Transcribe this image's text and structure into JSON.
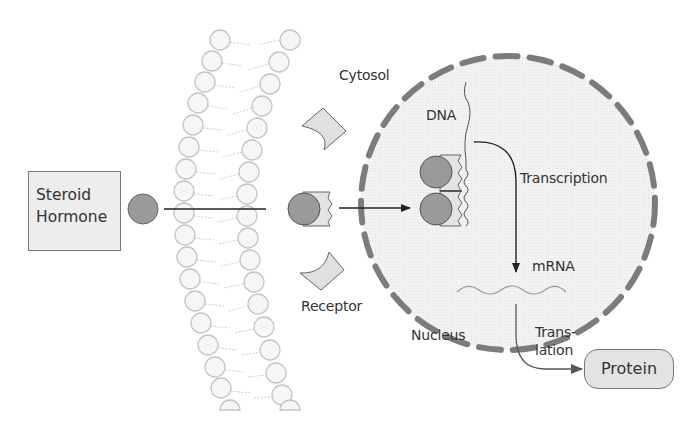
{
  "diagram": {
    "labels": {
      "steroid_hormone_line1": "Steroid",
      "steroid_hormone_line2": "Hormone",
      "cytosol": "Cytosol",
      "dna": "DNA",
      "transcription": "Transcription",
      "mrna": "mRNA",
      "receptor": "Receptor",
      "nucleus": "Nucleus",
      "translation_line1": "Trans-",
      "translation_line2": "lation",
      "protein": "Protein"
    },
    "colors": {
      "hormone_fill": "#9a9a9a",
      "membrane_stroke": "#c8c8c8",
      "nucleus_fill": "#efefef",
      "nucleus_border": "#7a7a7a",
      "receptor_fill": "#e0e0e0",
      "arrow": "#222222"
    },
    "nodes": [
      {
        "id": "steroid-hormone",
        "type": "box"
      },
      {
        "id": "cell-membrane",
        "type": "lipid-bilayer"
      },
      {
        "id": "receptor",
        "type": "shape"
      },
      {
        "id": "hormone-receptor-complex",
        "type": "shape"
      },
      {
        "id": "nucleus",
        "type": "circle-dashed"
      },
      {
        "id": "dna",
        "type": "strand"
      },
      {
        "id": "mrna",
        "type": "strand"
      },
      {
        "id": "protein",
        "type": "rounded-box"
      }
    ],
    "edges": [
      {
        "from": "steroid-hormone",
        "to": "hormone-receptor-complex",
        "label": ""
      },
      {
        "from": "hormone-receptor-complex",
        "to": "dna",
        "label": ""
      },
      {
        "from": "dna",
        "to": "mrna",
        "label": "Transcription"
      },
      {
        "from": "mrna",
        "to": "protein",
        "label": "Trans-lation"
      }
    ]
  }
}
